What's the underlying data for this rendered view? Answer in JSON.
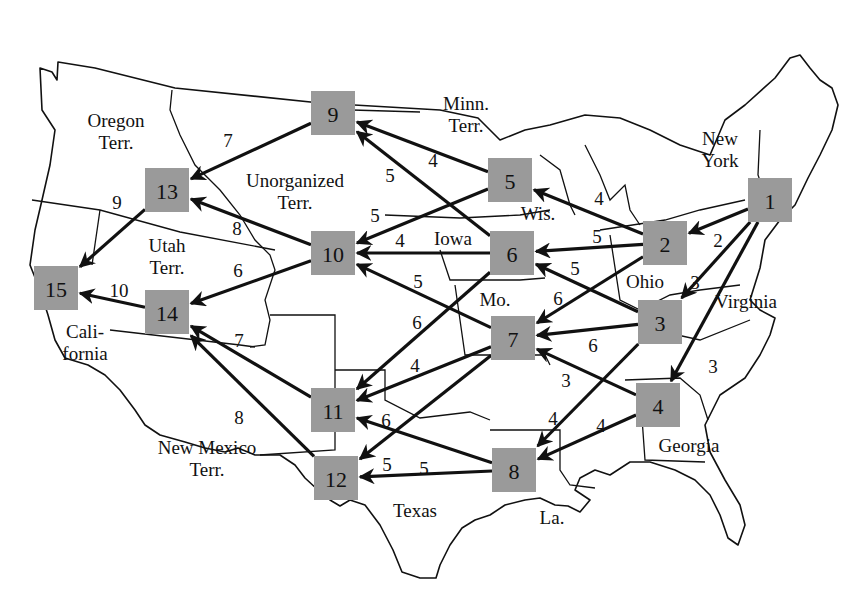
{
  "diagram": {
    "type": "directed-weighted-network-on-map",
    "node_color": "#9a9a9a",
    "edge_color": "#111111",
    "nodes": [
      {
        "id": "1",
        "label": "1",
        "x": 770,
        "y": 200
      },
      {
        "id": "2",
        "label": "2",
        "x": 665,
        "y": 243
      },
      {
        "id": "3",
        "label": "3",
        "x": 660,
        "y": 322
      },
      {
        "id": "4",
        "label": "4",
        "x": 658,
        "y": 405
      },
      {
        "id": "5",
        "label": "5",
        "x": 510,
        "y": 180
      },
      {
        "id": "6",
        "label": "6",
        "x": 512,
        "y": 253
      },
      {
        "id": "7",
        "label": "7",
        "x": 513,
        "y": 338
      },
      {
        "id": "8",
        "label": "8",
        "x": 514,
        "y": 470
      },
      {
        "id": "9",
        "label": "9",
        "x": 333,
        "y": 113
      },
      {
        "id": "10",
        "label": "10",
        "x": 333,
        "y": 253
      },
      {
        "id": "11",
        "label": "11",
        "x": 333,
        "y": 410
      },
      {
        "id": "12",
        "label": "12",
        "x": 336,
        "y": 478
      },
      {
        "id": "13",
        "label": "13",
        "x": 167,
        "y": 190
      },
      {
        "id": "14",
        "label": "14",
        "x": 167,
        "y": 312
      },
      {
        "id": "15",
        "label": "15",
        "x": 56,
        "y": 288
      }
    ],
    "edges": [
      {
        "from": "1",
        "to": "2",
        "weight": "2",
        "lx": 718,
        "ly": 240
      },
      {
        "from": "1",
        "to": "3",
        "weight": "3",
        "lx": 695,
        "ly": 282
      },
      {
        "from": "1",
        "to": "4",
        "weight": "3",
        "lx": 713,
        "ly": 366
      },
      {
        "from": "2",
        "to": "5",
        "weight": "4",
        "lx": 599,
        "ly": 198
      },
      {
        "from": "2",
        "to": "6",
        "weight": "5",
        "lx": 597,
        "ly": 236
      },
      {
        "from": "2",
        "to": "7",
        "weight": "6",
        "lx": 558,
        "ly": 298
      },
      {
        "from": "3",
        "to": "6",
        "weight": "5",
        "lx": 575,
        "ly": 268
      },
      {
        "from": "3",
        "to": "7",
        "weight": "6",
        "lx": 593,
        "ly": 345
      },
      {
        "from": "3",
        "to": "8",
        "weight": "4",
        "lx": 553,
        "ly": 418
      },
      {
        "from": "4",
        "to": "7",
        "weight": "3",
        "lx": 566,
        "ly": 380
      },
      {
        "from": "4",
        "to": "8",
        "weight": "4",
        "lx": 601,
        "ly": 425
      },
      {
        "from": "5",
        "to": "9",
        "weight": "4",
        "lx": 433,
        "ly": 160
      },
      {
        "from": "5",
        "to": "10",
        "weight": "5",
        "lx": 375,
        "ly": 215
      },
      {
        "from": "6",
        "to": "9",
        "weight": "5",
        "lx": 390,
        "ly": 175
      },
      {
        "from": "6",
        "to": "10",
        "weight": "4",
        "lx": 400,
        "ly": 240
      },
      {
        "from": "6",
        "to": "11",
        "weight": "6",
        "lx": 417,
        "ly": 322
      },
      {
        "from": "7",
        "to": "10",
        "weight": "5",
        "lx": 418,
        "ly": 281
      },
      {
        "from": "7",
        "to": "11",
        "weight": "4",
        "lx": 415,
        "ly": 365
      },
      {
        "from": "7",
        "to": "12",
        "weight": "5",
        "lx": 387,
        "ly": 464
      },
      {
        "from": "8",
        "to": "11",
        "weight": "6",
        "lx": 386,
        "ly": 420
      },
      {
        "from": "8",
        "to": "12",
        "weight": "5",
        "lx": 424,
        "ly": 468
      },
      {
        "from": "9",
        "to": "13",
        "weight": "7",
        "lx": 228,
        "ly": 140
      },
      {
        "from": "10",
        "to": "13",
        "weight": "8",
        "lx": 237,
        "ly": 228
      },
      {
        "from": "10",
        "to": "14",
        "weight": "6",
        "lx": 238,
        "ly": 270
      },
      {
        "from": "11",
        "to": "14",
        "weight": "7",
        "lx": 239,
        "ly": 340
      },
      {
        "from": "12",
        "to": "14",
        "weight": "8",
        "lx": 239,
        "ly": 417
      },
      {
        "from": "13",
        "to": "15",
        "weight": "9",
        "lx": 117,
        "ly": 202
      },
      {
        "from": "14",
        "to": "15",
        "weight": "10",
        "lx": 119,
        "ly": 290
      }
    ],
    "regions": [
      {
        "name": "oregon",
        "lines": [
          "Oregon",
          "Terr."
        ],
        "x": 116,
        "y": 127
      },
      {
        "name": "minnesota",
        "lines": [
          "Minn.",
          "Terr."
        ],
        "x": 466,
        "y": 110
      },
      {
        "name": "new-york",
        "lines": [
          "New",
          "York"
        ],
        "x": 720,
        "y": 145
      },
      {
        "name": "unorganized",
        "lines": [
          "Unorganized",
          "Terr."
        ],
        "x": 295,
        "y": 187
      },
      {
        "name": "wisconsin",
        "lines": [
          "Wis."
        ],
        "x": 538,
        "y": 220
      },
      {
        "name": "iowa",
        "lines": [
          "Iowa"
        ],
        "x": 453,
        "y": 245
      },
      {
        "name": "utah",
        "lines": [
          "Utah",
          "Terr."
        ],
        "x": 167,
        "y": 252
      },
      {
        "name": "ohio",
        "lines": [
          "Ohio"
        ],
        "x": 645,
        "y": 288
      },
      {
        "name": "virginia",
        "lines": [
          "Virginia"
        ],
        "x": 746,
        "y": 308
      },
      {
        "name": "missouri",
        "lines": [
          "Mo."
        ],
        "x": 495,
        "y": 306
      },
      {
        "name": "california",
        "lines": [
          "Cali-",
          "fornia"
        ],
        "x": 85,
        "y": 338
      },
      {
        "name": "georgia",
        "lines": [
          "Georgia"
        ],
        "x": 689,
        "y": 452
      },
      {
        "name": "new-mexico",
        "lines": [
          "New Mexico",
          "Terr."
        ],
        "x": 207,
        "y": 454
      },
      {
        "name": "texas",
        "lines": [
          "Texas"
        ],
        "x": 415,
        "y": 517
      },
      {
        "name": "louisiana",
        "lines": [
          "La."
        ],
        "x": 552,
        "y": 524
      }
    ]
  }
}
